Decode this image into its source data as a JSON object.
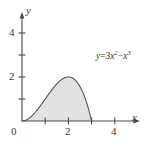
{
  "figure": {
    "name": "area-under-curve-figure",
    "background_color": "#ffffff",
    "fill_color": "#e2e2e2",
    "stroke_color": "#555555",
    "axis_color": "#4a4a4a"
  },
  "axes": {
    "x_axis_label": "x",
    "y_axis_label": "y",
    "origin_label": "0",
    "x_tick_labels": [
      "2",
      "4"
    ],
    "y_tick_labels": [
      "2",
      "4"
    ],
    "x_ticks_all": [
      1,
      2,
      3,
      4
    ],
    "y_ticks_all": [
      1,
      2,
      3,
      4
    ],
    "x_range": [
      0,
      4.6
    ],
    "y_range": [
      0,
      4.9
    ]
  },
  "equation": {
    "lhs": "y",
    "equals": "=",
    "coefficient": "3",
    "term1_base": "x",
    "term1_exponent": "2",
    "minus": "−",
    "term2_base": "x",
    "term2_exponent": "3",
    "plain": "y = 3x² − x³"
  },
  "chart_data": {
    "type": "area",
    "title": "",
    "xlabel": "x",
    "ylabel": "y",
    "xlim": [
      0,
      4.6
    ],
    "ylim": [
      0,
      4.9
    ],
    "grid": false,
    "legend": false,
    "function": "y = 3x^2 - x^3",
    "shaded_region": {
      "from": 0,
      "to": 3,
      "fill": "#e2e2e2",
      "description": "region bounded by the curve and the x-axis from x=0 to x=3"
    },
    "x": [
      0,
      0.25,
      0.5,
      0.75,
      1,
      1.25,
      1.5,
      1.75,
      2,
      2.25,
      2.5,
      2.75,
      3
    ],
    "y": [
      0,
      0.172,
      0.625,
      1.266,
      2,
      2.734,
      3.375,
      3.828,
      4,
      3.797,
      3.125,
      1.891,
      0
    ],
    "maximum": {
      "x": 2,
      "y": 4
    },
    "roots": [
      0,
      3
    ]
  }
}
